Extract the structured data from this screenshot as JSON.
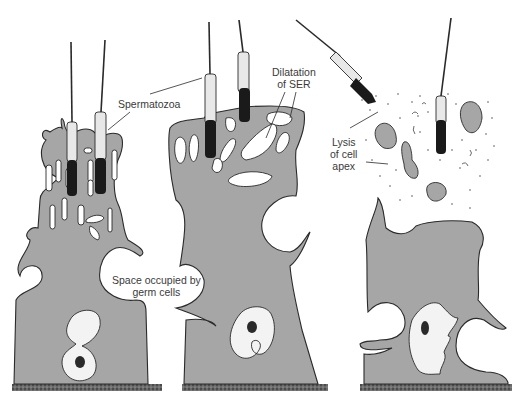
{
  "figure": {
    "colors": {
      "cytoplasm": "#a6a6a6",
      "outline": "#2a2a2a",
      "sperm_head": "#1a1a1a",
      "sperm_midpiece": "#e8e8e8",
      "nucleus": "#f3f3f3",
      "basement": "#555555"
    },
    "panels": [
      {
        "name": "stage-1",
        "description": "Apical processes enclosing spermatozoa"
      },
      {
        "name": "stage-2",
        "description": "Spermatozoa release with dilatation of SER"
      },
      {
        "name": "stage-3",
        "description": "Lysis of cell apex"
      }
    ],
    "labels": {
      "spermatozoa": "Spermatozoa",
      "dilatation_line1": "Dilatation",
      "dilatation_line2": "of SER",
      "lysis_line1": "Lysis",
      "lysis_line2": "of cell",
      "lysis_line3": "apex",
      "space_line1": "Space occupied by",
      "space_line2": "germ cells"
    }
  }
}
